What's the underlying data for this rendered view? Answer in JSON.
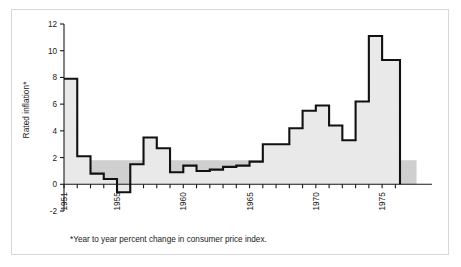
{
  "figure": {
    "frame_border_color": "#d8d8d8",
    "background_color": "#ffffff"
  },
  "chart_data": {
    "type": "area",
    "subtype": "step-area",
    "title": "",
    "subtitle": "",
    "xlabel": "",
    "ylabel": "Rated inflation*",
    "footnote": "*Year to year percent change in consumer price index.",
    "xlim": [
      1951,
      1977
    ],
    "ylim": [
      -2,
      12
    ],
    "y_ticks": [
      -2,
      0,
      2,
      4,
      6,
      8,
      10,
      12
    ],
    "y_tick_labels": [
      "-2",
      "0",
      "2",
      "4",
      "6",
      "8",
      "10",
      "12"
    ],
    "x_ticks": [
      1951,
      1955,
      1960,
      1965,
      1970,
      1975
    ],
    "x_tick_labels": [
      "1951",
      "1955",
      "1960",
      "1965",
      "1970",
      "1975"
    ],
    "x_minor_ticks": [
      1951,
      1952,
      1953,
      1954,
      1955,
      1956,
      1957,
      1958,
      1959,
      1960,
      1961,
      1962,
      1963,
      1964,
      1965,
      1966,
      1967,
      1968,
      1969,
      1970,
      1971,
      1972,
      1973,
      1974,
      1975,
      1976
    ],
    "grid": false,
    "legend": null,
    "zero_line": 0,
    "reference_band": {
      "label": "shaded band",
      "y_from": 0,
      "y_to": 1.8,
      "x_from": 1951,
      "x_to": 1977.6,
      "color": "#cfcfcf"
    },
    "series": [
      {
        "name": "Rate of inflation",
        "step": "post",
        "line_color": "#111111",
        "fill_color": "#e9e9e9",
        "x": [
          1951,
          1952,
          1953,
          1954,
          1955,
          1956,
          1957,
          1958,
          1959,
          1960,
          1961,
          1962,
          1963,
          1964,
          1965,
          1966,
          1967,
          1968,
          1969,
          1970,
          1971,
          1972,
          1973,
          1974,
          1975,
          1976
        ],
        "values": [
          7.9,
          2.1,
          0.8,
          0.4,
          -0.6,
          1.5,
          3.5,
          2.7,
          0.9,
          1.4,
          1.0,
          1.1,
          1.3,
          1.4,
          1.7,
          3.0,
          3.0,
          4.2,
          5.5,
          5.9,
          4.4,
          3.3,
          6.2,
          11.1,
          9.3,
          9.3
        ]
      }
    ]
  }
}
